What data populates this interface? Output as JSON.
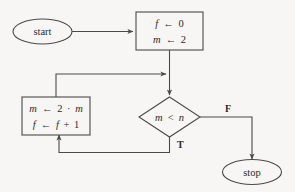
{
  "diagram": {
    "background_color": "#f7f6f4",
    "line_color": "#4a4a4a",
    "text_color": "#2b2b2b",
    "nodes": {
      "start": {
        "label": "start",
        "shape": "ellipse"
      },
      "init": {
        "shape": "process",
        "line1_var": "f",
        "line1_arrow": "←",
        "line1_value": "0",
        "line2_var": "m",
        "line2_arrow": "←",
        "line2_value": "2"
      },
      "body": {
        "shape": "process",
        "line1_var": "m",
        "line1_arrow": "←",
        "line1_rhs_a": "2",
        "line1_dot": "·",
        "line1_rhs_b": "m",
        "line2_var": "f",
        "line2_arrow": "←",
        "line2_rhs_a": "f",
        "line2_plus": "+",
        "line2_rhs_b": "1"
      },
      "decision": {
        "shape": "diamond",
        "lhs": "m",
        "operator": "<",
        "rhs": "n"
      },
      "stop": {
        "label": "stop",
        "shape": "ellipse"
      }
    },
    "branches": {
      "true_label": "T",
      "false_label": "F"
    }
  }
}
